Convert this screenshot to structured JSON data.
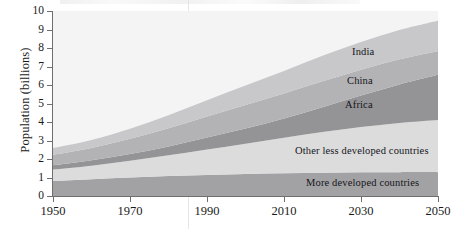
{
  "chart_data": {
    "type": "area",
    "stacked": true,
    "title": "",
    "xlabel": "",
    "ylabel": "Population (billions)",
    "xlim": [
      1950,
      2050
    ],
    "ylim": [
      0,
      10
    ],
    "grid": false,
    "legend_position": "inline-on-bands",
    "xticks": [
      "1950",
      "1970",
      "1990",
      "2010",
      "2030",
      "2050"
    ],
    "xtick_values": [
      1950,
      1970,
      1990,
      2010,
      2030,
      2050
    ],
    "yticks": [
      "0",
      "1",
      "2",
      "3",
      "4",
      "5",
      "6",
      "7",
      "8",
      "9",
      "10"
    ],
    "ytick_values": [
      0,
      1,
      2,
      3,
      4,
      5,
      6,
      7,
      8,
      9,
      10
    ],
    "x": [
      1950,
      1960,
      1970,
      1980,
      1990,
      2000,
      2010,
      2020,
      2030,
      2040,
      2050
    ],
    "series": [
      {
        "name": "More developed countries",
        "color": "#a2a2a4",
        "values": [
          0.81,
          0.91,
          1.0,
          1.08,
          1.14,
          1.19,
          1.23,
          1.26,
          1.28,
          1.29,
          1.29
        ]
      },
      {
        "name": "Other less developed countries",
        "color": "#dcdcdd",
        "values": [
          0.62,
          0.73,
          0.9,
          1.12,
          1.38,
          1.64,
          1.92,
          2.2,
          2.45,
          2.66,
          2.82
        ]
      },
      {
        "name": "Africa",
        "color": "#949497",
        "values": [
          0.23,
          0.29,
          0.37,
          0.48,
          0.64,
          0.82,
          1.04,
          1.34,
          1.7,
          2.08,
          2.44
        ]
      },
      {
        "name": "China",
        "color": "#b3b3b5",
        "values": [
          0.56,
          0.66,
          0.82,
          0.98,
          1.14,
          1.27,
          1.35,
          1.4,
          1.4,
          1.36,
          1.29
        ]
      },
      {
        "name": "India",
        "color": "#c8c8ca",
        "values": [
          0.37,
          0.44,
          0.55,
          0.7,
          0.87,
          1.05,
          1.22,
          1.38,
          1.5,
          1.58,
          1.63
        ]
      }
    ],
    "series_labels": [
      {
        "name": "India",
        "text": "India",
        "x_px": 352,
        "y_px": 46
      },
      {
        "name": "China",
        "text": "China",
        "x_px": 347,
        "y_px": 75
      },
      {
        "name": "Africa",
        "text": "Africa",
        "x_px": 345,
        "y_px": 99
      },
      {
        "name": "Other less developed countries",
        "text": "Other less developed countries",
        "x_px": 295,
        "y_px": 145
      },
      {
        "name": "More developed countries",
        "text": "More developed countries",
        "x_px": 306,
        "y_px": 177
      }
    ],
    "totals_note": {
      "start_total": 2.59,
      "end_total": 9.47
    },
    "colors": {
      "plot_background": "#f4f4f5",
      "axis": "#6f6f72",
      "text": "#1a1a1a"
    }
  }
}
